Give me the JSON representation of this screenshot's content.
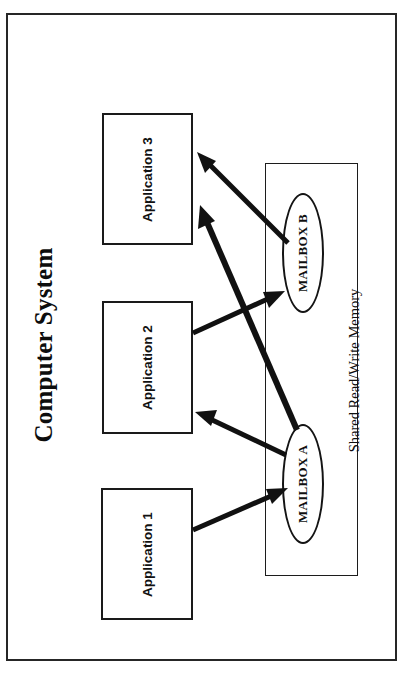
{
  "figure": {
    "title": "Computer System",
    "frame": {
      "border_color": "#262626"
    },
    "background_color": "#ffffff"
  },
  "applications": [
    {
      "id": "app3",
      "label": "Application 3"
    },
    {
      "id": "app2",
      "label": "Application 2"
    },
    {
      "id": "app1",
      "label": "Application 1"
    }
  ],
  "memory": {
    "label": "Shared  Read/Write  Memory",
    "mailboxes": [
      {
        "id": "mailbox-b",
        "label": "MAILBOX B"
      },
      {
        "id": "mailbox-a",
        "label": "MAILBOX A"
      }
    ]
  },
  "connections": [
    {
      "from": "Application 1",
      "to": "MAILBOX A",
      "direction": "write"
    },
    {
      "from": "MAILBOX A",
      "to": "Application 2",
      "direction": "read"
    },
    {
      "from": "Application 2",
      "to": "MAILBOX B",
      "direction": "write"
    },
    {
      "from": "MAILBOX B",
      "to": "Application 3",
      "direction": "read"
    },
    {
      "from": "MAILBOX A",
      "to": "Application 3",
      "direction": "read"
    }
  ],
  "colors": {
    "stroke": "#111111",
    "frame": "#262626",
    "text": "#0d0d0d"
  }
}
